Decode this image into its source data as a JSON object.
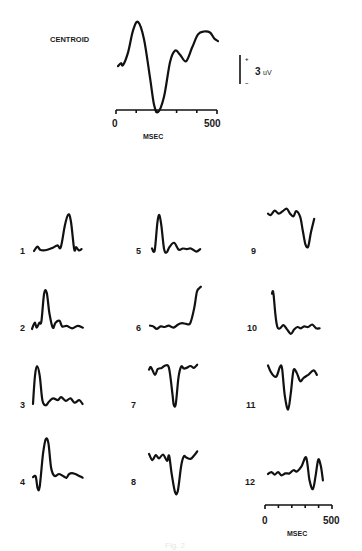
{
  "figure": {
    "centroid_label": "CENTROID",
    "scale_bar": {
      "plus": "+",
      "minus": "–",
      "value": "3",
      "unit": "uV"
    },
    "top_axis": {
      "start": "0",
      "end": "500",
      "label": "MSEC"
    },
    "bottom_axis": {
      "start": "0",
      "end": "500",
      "label": "MSEC"
    },
    "caption": "Fig. 2",
    "line_color": "#111111",
    "background": "#ffffff"
  },
  "chart_data": {
    "type": "line",
    "title": "",
    "xlabel": "MSEC",
    "ylabel": "uV",
    "xlim": [
      0,
      500
    ],
    "scale_bar_uV": 3,
    "x_ticks": [
      0,
      100,
      200,
      300,
      400,
      500
    ],
    "note": "Values are approximate amplitudes in uV (positive up) read from the traces; x in ms (0-500).",
    "centroid": {
      "name": "CENTROID",
      "x": [
        0,
        15,
        25,
        50,
        75,
        100,
        130,
        160,
        180,
        200,
        230,
        260,
        285,
        310,
        340,
        370,
        400,
        430,
        460,
        480,
        500
      ],
      "values": [
        0.2,
        0.5,
        0.3,
        1.6,
        3.9,
        4.8,
        3.0,
        -1.0,
        -3.8,
        -4.6,
        -3.0,
        0.6,
        1.8,
        1.4,
        0.7,
        2.1,
        3.5,
        3.8,
        3.7,
        3.1,
        2.8
      ]
    },
    "series": [
      {
        "name": "1",
        "x": [
          0,
          25,
          45,
          70,
          100,
          140,
          175,
          200,
          230,
          255,
          275,
          300,
          315,
          335,
          355
        ],
        "values": [
          0,
          0.7,
          0.2,
          0.1,
          0.2,
          0.5,
          0.9,
          0.6,
          4.0,
          5.8,
          4.8,
          0.3,
          0.6,
          0.1,
          0.3
        ]
      },
      {
        "name": "2",
        "x": [
          0,
          20,
          35,
          55,
          70,
          90,
          110,
          130,
          155,
          175,
          205,
          225,
          260,
          300,
          340,
          380
        ],
        "values": [
          0,
          1.0,
          0.2,
          1.0,
          1.2,
          5.6,
          5.8,
          2.5,
          0.2,
          1.0,
          1.3,
          0.4,
          0.5,
          0.1,
          0.5,
          0.2
        ]
      },
      {
        "name": "3",
        "x": [
          0,
          15,
          30,
          50,
          70,
          95,
          120,
          150,
          185,
          210,
          245,
          280,
          310,
          345,
          370
        ],
        "values": [
          0,
          4.5,
          6.0,
          4.5,
          0.6,
          -0.2,
          0.4,
          0.9,
          0.6,
          1.1,
          0.5,
          0.9,
          0.2,
          0.6,
          0.0
        ]
      },
      {
        "name": "4",
        "x": [
          0,
          20,
          35,
          50,
          75,
          95,
          115,
          135,
          160,
          195,
          230,
          250,
          270,
          300,
          335,
          370
        ],
        "values": [
          0.3,
          0.4,
          -1.5,
          -1.2,
          4.0,
          6.3,
          5.7,
          1.8,
          0.5,
          0.8,
          0.4,
          0.2,
          0.8,
          0.9,
          0.6,
          0.2
        ]
      },
      {
        "name": "5",
        "x": [
          0,
          20,
          40,
          55,
          70,
          90,
          110,
          130,
          165,
          200,
          230,
          260,
          290,
          330,
          360
        ],
        "values": [
          0.4,
          0.1,
          4.5,
          5.7,
          4.0,
          0.3,
          -0.2,
          0.6,
          1.3,
          0.2,
          0.4,
          0.3,
          0.4,
          -0.1,
          0.3
        ]
      },
      {
        "name": "6",
        "x": [
          0,
          25,
          50,
          80,
          110,
          140,
          175,
          210,
          240,
          270,
          300,
          330,
          350,
          370,
          380
        ],
        "values": [
          0.2,
          0.1,
          -0.3,
          0.1,
          0.0,
          0.2,
          -0.1,
          0.4,
          0.6,
          0.5,
          0.6,
          3.0,
          5.6,
          6.2,
          6.4
        ]
      },
      {
        "name": "7",
        "x": [
          0,
          15,
          45,
          65,
          95,
          125,
          150,
          175,
          185,
          200,
          220,
          240,
          260,
          280,
          310,
          335,
          360
        ],
        "values": [
          0.2,
          0.6,
          -0.6,
          0.3,
          0.5,
          0.9,
          0.4,
          -3.6,
          -5.4,
          -5.2,
          -1.0,
          0.7,
          0.4,
          0.5,
          0.8,
          0.5,
          1.0
        ]
      },
      {
        "name": "8",
        "x": [
          0,
          25,
          50,
          75,
          105,
          135,
          150,
          170,
          195,
          215,
          240,
          260,
          280,
          310,
          335,
          360
        ],
        "values": [
          0.5,
          -0.5,
          0.3,
          -0.2,
          0.4,
          -0.6,
          0.2,
          -2.8,
          -5.6,
          -5.4,
          -1.4,
          0.1,
          -0.1,
          -0.3,
          0.2,
          0.9
        ]
      },
      {
        "name": "9",
        "x": [
          0,
          20,
          50,
          80,
          110,
          140,
          165,
          190,
          210,
          240,
          260,
          280,
          300,
          320,
          345
        ],
        "values": [
          0.2,
          0.0,
          0.7,
          0.2,
          0.6,
          1.0,
          0.2,
          -0.2,
          0.6,
          -0.3,
          -2.5,
          -4.7,
          -5.0,
          -2.8,
          -0.6
        ]
      },
      {
        "name": "10",
        "x": [
          0,
          10,
          25,
          40,
          60,
          85,
          110,
          140,
          165,
          190,
          215,
          240,
          270,
          300,
          330,
          355
        ],
        "values": [
          5.3,
          5.5,
          2.0,
          0.0,
          -0.2,
          0.3,
          -0.3,
          -1.1,
          -0.4,
          0.0,
          -0.2,
          0.1,
          0.0,
          0.4,
          -0.2,
          -0.2
        ]
      },
      {
        "name": "11",
        "x": [
          0,
          20,
          45,
          65,
          90,
          105,
          125,
          150,
          170,
          190,
          215,
          240,
          265,
          300,
          340,
          365
        ],
        "values": [
          2.0,
          1.0,
          0.3,
          0.3,
          1.8,
          1.5,
          -2.8,
          -5.0,
          -2.4,
          1.2,
          0.8,
          -0.5,
          0.0,
          0.5,
          1.2,
          0.5
        ]
      },
      {
        "name": "12",
        "x": [
          0,
          25,
          50,
          75,
          100,
          130,
          160,
          190,
          215,
          250,
          285,
          310,
          335,
          355,
          375,
          395,
          410
        ],
        "values": [
          0,
          0.3,
          -0.1,
          0.3,
          -0.2,
          0.1,
          0.1,
          0.6,
          0.4,
          1.2,
          2.6,
          -1.0,
          -2.4,
          -0.3,
          2.3,
          1.2,
          -1.0
        ]
      }
    ]
  }
}
